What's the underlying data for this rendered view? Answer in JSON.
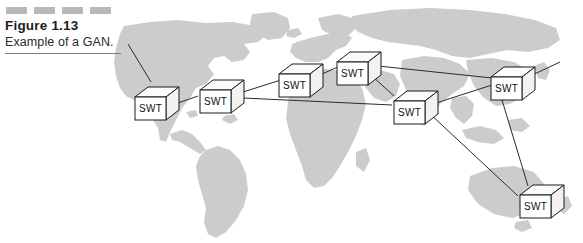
{
  "figure": {
    "number": "Figure 1.13",
    "caption": "Example of a GAN.",
    "decoration": {
      "dash_count": 4,
      "dash_color": "#b9b9b9"
    },
    "rule_color": "#7d7d7d"
  },
  "diagram": {
    "type": "network-topology-on-world-map",
    "map": {
      "land_color": "#cccccc",
      "background_color": "#ffffff",
      "projection_hint": "world-map-equirectangular"
    },
    "link_color": "#2b2b2b",
    "node_label": "SWT",
    "nodes": [
      {
        "id": "swt-1",
        "label": "SWT",
        "region": "north-america-west",
        "x": 131,
        "y": 85
      },
      {
        "id": "swt-2",
        "label": "SWT",
        "region": "north-america-east",
        "x": 196,
        "y": 78
      },
      {
        "id": "swt-3",
        "label": "SWT",
        "region": "europe-west",
        "x": 275,
        "y": 62
      },
      {
        "id": "swt-4",
        "label": "SWT",
        "region": "europe-north",
        "x": 333,
        "y": 50
      },
      {
        "id": "swt-5",
        "label": "SWT",
        "region": "middle-east",
        "x": 390,
        "y": 89
      },
      {
        "id": "swt-6",
        "label": "SWT",
        "region": "asia-east",
        "x": 487,
        "y": 65
      },
      {
        "id": "swt-7",
        "label": "SWT",
        "region": "australia",
        "x": 516,
        "y": 183
      }
    ],
    "links": [
      {
        "from": "swt-1",
        "to": "swt-2"
      },
      {
        "from": "swt-2",
        "to": "swt-3"
      },
      {
        "from": "swt-3",
        "to": "swt-4"
      },
      {
        "from": "swt-2",
        "to": "swt-5"
      },
      {
        "from": "swt-4",
        "to": "swt-5"
      },
      {
        "from": "swt-4",
        "to": "swt-6"
      },
      {
        "from": "swt-5",
        "to": "swt-6"
      },
      {
        "from": "swt-5",
        "to": "swt-7"
      },
      {
        "from": "swt-6",
        "to": "swt-7"
      }
    ],
    "edge_stubs": [
      {
        "from": "swt-1",
        "direction": "up-left"
      },
      {
        "from": "swt-6",
        "direction": "up-right"
      }
    ]
  }
}
